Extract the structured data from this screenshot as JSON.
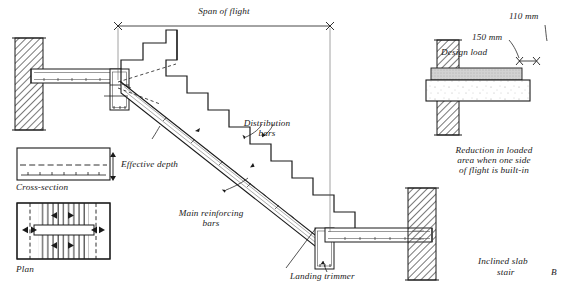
{
  "figure": {
    "title_label": "Inclined slab",
    "subtitle_label": "stair",
    "figure_letter": "B"
  },
  "main_section": {
    "span_label": "Span of flight",
    "distribution_label_line1": "Distribution",
    "distribution_label_line2": "bars",
    "main_bars_label_line1": "Main reinforcing",
    "main_bars_label_line2": "bars",
    "landing_trimmer_label": "Landing trimmer",
    "effective_depth_label": "Effective depth"
  },
  "cross_section": {
    "caption": "Cross-section"
  },
  "plan": {
    "caption": "Plan"
  },
  "detail": {
    "dim_110_label": "110 mm",
    "dim_150_label": "150 mm",
    "design_load_label": "Design load",
    "caption_line1": "Reduction in loaded",
    "caption_line2": "area when one side",
    "caption_line3": "of flight is built-in"
  },
  "colors": {
    "line": "#1a1a1a",
    "hatch": "#555555",
    "concrete_fill": "#fdfdfd",
    "load_fill": "#c9c9c9",
    "background": "#ffffff"
  }
}
